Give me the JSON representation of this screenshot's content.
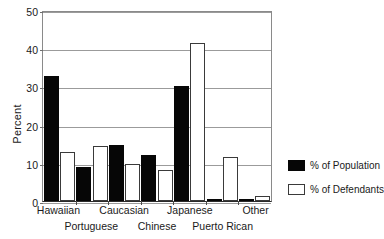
{
  "chart_data": {
    "type": "bar",
    "title": "",
    "xlabel": "",
    "ylabel": "Percent",
    "ylim": [
      0,
      50
    ],
    "yticks": [
      0,
      10,
      20,
      30,
      40,
      50
    ],
    "ytick_labels": [
      "0",
      "10",
      "20",
      "30",
      "40",
      "50"
    ],
    "grid": true,
    "legend_position": "right",
    "categories": [
      "Hawaiian",
      "Portuguese",
      "Caucasian",
      "Chinese",
      "Japanese",
      "Puerto Rican",
      "Other"
    ],
    "category_rows": [
      0,
      1,
      0,
      1,
      0,
      1,
      0
    ],
    "series": [
      {
        "name": "% of Population",
        "color": "#060606",
        "values": [
          32.8,
          9.0,
          14.6,
          12.0,
          30.0,
          0.0,
          0.5
        ]
      },
      {
        "name": "% of Defendants",
        "color": "#ffffff",
        "values": [
          12.8,
          14.3,
          9.8,
          8.1,
          41.3,
          11.4,
          1.2
        ]
      }
    ]
  },
  "axis": {
    "y_title": "Percent"
  },
  "legend": {
    "items": [
      {
        "label": "% of Population",
        "style": "filled"
      },
      {
        "label": "% of Defendants",
        "style": "outline"
      }
    ]
  },
  "colors": {
    "population": "#060606",
    "defendants": "#ffffff",
    "axis": "#2b2b2b",
    "grid": "#9b9b9b",
    "background": "#ffffff"
  }
}
